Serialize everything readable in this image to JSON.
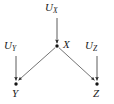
{
  "figure": {
    "type": "causal-diagram",
    "background_color": "#ffffff",
    "ink_color": "#3a3a3a",
    "node_dot_color": "#1a1a1a",
    "width": 114,
    "height": 104
  },
  "nodes": [
    {
      "id": "X",
      "label": "X",
      "subscript": "",
      "x": 57,
      "y": 46,
      "kind": "endogenous",
      "dot": true
    },
    {
      "id": "Y",
      "label": "Y",
      "subscript": "",
      "x": 16,
      "y": 84,
      "kind": "endogenous",
      "dot": true
    },
    {
      "id": "Z",
      "label": "Z",
      "subscript": "",
      "x": 97,
      "y": 84,
      "kind": "endogenous",
      "dot": true
    },
    {
      "id": "UX",
      "label": "U",
      "subscript": "X",
      "x": 57,
      "y": 9,
      "kind": "exogenous",
      "dot": false
    },
    {
      "id": "UY",
      "label": "U",
      "subscript": "Y",
      "x": 16,
      "y": 47,
      "kind": "exogenous",
      "dot": false
    },
    {
      "id": "UZ",
      "label": "U",
      "subscript": "Z",
      "x": 97,
      "y": 47,
      "kind": "exogenous",
      "dot": false
    }
  ],
  "edges": [
    {
      "from": "UX",
      "to": "X",
      "x1": 57,
      "y1": 18,
      "x2": 57,
      "y2": 44,
      "arrowhead": true
    },
    {
      "from": "UY",
      "to": "Y",
      "x1": 16,
      "y1": 56,
      "x2": 16,
      "y2": 81,
      "arrowhead": true
    },
    {
      "from": "UZ",
      "to": "Z",
      "x1": 97,
      "y1": 56,
      "x2": 97,
      "y2": 81,
      "arrowhead": true
    },
    {
      "from": "X",
      "to": "Y",
      "x1": 55,
      "y1": 48,
      "x2": 19,
      "y2": 80,
      "arrowhead": true
    },
    {
      "from": "X",
      "to": "Z",
      "x1": 59,
      "y1": 48,
      "x2": 94,
      "y2": 80,
      "arrowhead": true
    }
  ],
  "labels": {
    "ux": {
      "base": "U",
      "sub": "X"
    },
    "uy": {
      "base": "U",
      "sub": "Y"
    },
    "uz": {
      "base": "U",
      "sub": "Z"
    },
    "x": {
      "base": "X"
    },
    "y": {
      "base": "Y"
    },
    "z": {
      "base": "Z"
    }
  }
}
